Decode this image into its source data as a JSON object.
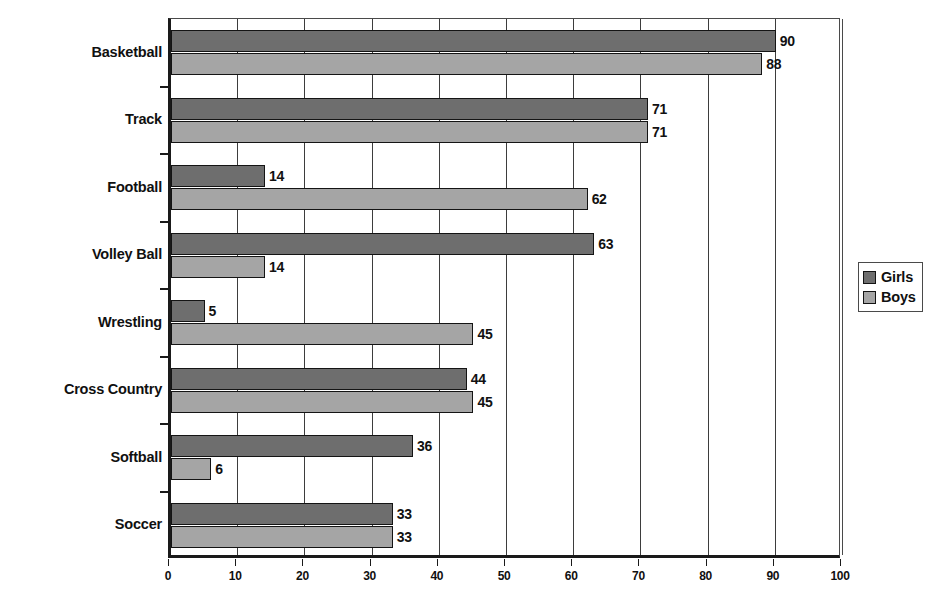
{
  "chart_data": {
    "type": "bar",
    "orientation": "horizontal",
    "title": "",
    "xlabel": "",
    "ylabel": "",
    "xlim": [
      0,
      100
    ],
    "xticks": [
      "0",
      "10",
      "20",
      "30",
      "40",
      "50",
      "60",
      "70",
      "80",
      "90",
      "100"
    ],
    "grid": true,
    "legend_position": "right",
    "categories": [
      "Basketball",
      "Track",
      "Football",
      "Volley Ball",
      "Wrestling",
      "Cross Country",
      "Softball",
      "Soccer"
    ],
    "series": [
      {
        "name": "Girls",
        "color": "#6e6e6e",
        "values": [
          90,
          71,
          14,
          63,
          5,
          44,
          36,
          33
        ]
      },
      {
        "name": "Boys",
        "color": "#a5a5a5",
        "values": [
          88,
          71,
          62,
          14,
          45,
          45,
          6,
          33
        ]
      }
    ]
  },
  "legend": {
    "items": [
      {
        "label": "Girls",
        "swatch": "girls"
      },
      {
        "label": "Boys",
        "swatch": "boys"
      }
    ]
  },
  "title_strip": ""
}
